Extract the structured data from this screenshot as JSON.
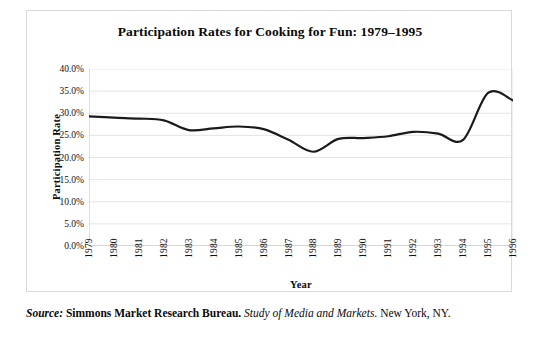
{
  "chart_data": {
    "type": "line",
    "title": "Participation Rates for Cooking for Fun: 1979–1995",
    "xlabel": "Year",
    "ylabel": "Participation Rate",
    "grid": true,
    "legend": "none",
    "xlim": [
      1979,
      1996
    ],
    "ylim": [
      0,
      40
    ],
    "ytick_labels": [
      "40.0%",
      "35.0%",
      "30.0%",
      "25.0%",
      "20.0%",
      "15.0%",
      "10.0%",
      "5.0%",
      "0.0%"
    ],
    "ytick_values": [
      40,
      35,
      30,
      25,
      20,
      15,
      10,
      5,
      0
    ],
    "categories": [
      "1979",
      "1980",
      "1981",
      "1982",
      "1983",
      "1984",
      "1985",
      "1986",
      "1987",
      "1988",
      "1989",
      "1990",
      "1991",
      "1992",
      "1993",
      "1994",
      "1995",
      "1996"
    ],
    "x": [
      1979,
      1980,
      1981,
      1982,
      1983,
      1984,
      1985,
      1986,
      1987,
      1988,
      1989,
      1990,
      1991,
      1992,
      1993,
      1994,
      1995,
      1996
    ],
    "values": [
      29.3,
      29.0,
      28.8,
      28.4,
      26.2,
      26.6,
      27.0,
      26.4,
      24.0,
      21.3,
      24.2,
      24.4,
      24.8,
      25.8,
      25.4,
      24.0,
      34.6,
      32.9
    ],
    "series": [
      {
        "name": "Participation Rate",
        "color": "#1a1a1a",
        "line_width": 2.2,
        "smoothing": "spline",
        "values": [
          29.3,
          29.0,
          28.8,
          28.4,
          26.2,
          26.6,
          27.0,
          26.4,
          24.0,
          21.3,
          24.2,
          24.4,
          24.8,
          25.8,
          25.4,
          24.0,
          34.6,
          32.9
        ]
      }
    ],
    "units": "percent"
  },
  "source": {
    "label": "Source:",
    "publisher": "Simmons Market Research Bureau.",
    "publication": "Study of Media and Markets.",
    "location": "New York, NY."
  },
  "colors": {
    "line": "#1a1a1a",
    "grid": "#d8d8d8",
    "axis": "#bdbdbd",
    "border": "#d9d9d9",
    "text": "#0a0a0a",
    "background": "#ffffff"
  }
}
